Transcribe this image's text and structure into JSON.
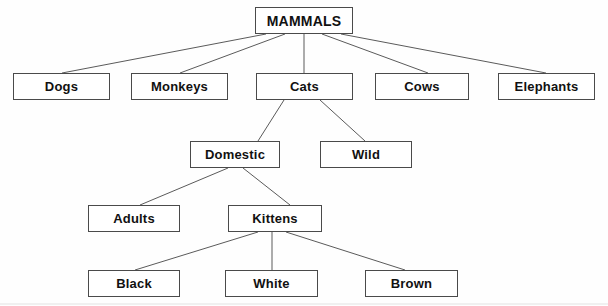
{
  "diagram": {
    "title": "MAMMALS",
    "type": "hierarchical-tree",
    "background_color": "#fefefe",
    "box_border_color": "#4a4a4a",
    "line_color": "#5a5a5a",
    "text_color": "#111111",
    "canvas": {
      "width": 608,
      "height": 306
    }
  },
  "nodes": [
    {
      "id": "mammals",
      "label": "MAMMALS",
      "level": 0,
      "x": 255,
      "y": 7,
      "w": 98,
      "h": 27,
      "font_size": 14,
      "parent": null
    },
    {
      "id": "dogs",
      "label": "Dogs",
      "level": 1,
      "x": 13,
      "y": 73,
      "w": 97,
      "h": 27,
      "font_size": 13,
      "parent": "mammals"
    },
    {
      "id": "monkeys",
      "label": "Monkeys",
      "level": 1,
      "x": 131,
      "y": 73,
      "w": 97,
      "h": 27,
      "font_size": 13,
      "parent": "mammals"
    },
    {
      "id": "cats",
      "label": "Cats",
      "level": 1,
      "x": 256,
      "y": 73,
      "w": 97,
      "h": 27,
      "font_size": 13,
      "parent": "mammals"
    },
    {
      "id": "cows",
      "label": "Cows",
      "level": 1,
      "x": 375,
      "y": 73,
      "w": 94,
      "h": 27,
      "font_size": 13,
      "parent": "mammals"
    },
    {
      "id": "elephants",
      "label": "Elephants",
      "level": 1,
      "x": 498,
      "y": 73,
      "w": 97,
      "h": 27,
      "font_size": 13,
      "parent": "mammals"
    },
    {
      "id": "domestic",
      "label": "Domestic",
      "level": 2,
      "x": 190,
      "y": 141,
      "w": 90,
      "h": 27,
      "font_size": 13,
      "parent": "cats"
    },
    {
      "id": "wild",
      "label": "Wild",
      "level": 2,
      "x": 320,
      "y": 141,
      "w": 92,
      "h": 27,
      "font_size": 13,
      "parent": "cats"
    },
    {
      "id": "adults",
      "label": "Adults",
      "level": 3,
      "x": 88,
      "y": 205,
      "w": 92,
      "h": 27,
      "font_size": 13,
      "parent": "domestic"
    },
    {
      "id": "kittens",
      "label": "Kittens",
      "level": 3,
      "x": 228,
      "y": 205,
      "w": 94,
      "h": 27,
      "font_size": 13,
      "parent": "domestic"
    },
    {
      "id": "black",
      "label": "Black",
      "level": 4,
      "x": 88,
      "y": 270,
      "w": 92,
      "h": 27,
      "font_size": 13,
      "parent": "kittens"
    },
    {
      "id": "white",
      "label": "White",
      "level": 4,
      "x": 225,
      "y": 270,
      "w": 93,
      "h": 27,
      "font_size": 13,
      "parent": "kittens"
    },
    {
      "id": "brown",
      "label": "Brown",
      "level": 4,
      "x": 365,
      "y": 270,
      "w": 93,
      "h": 27,
      "font_size": 13,
      "parent": "kittens"
    }
  ],
  "edges": [
    {
      "id": "mammals-dogs",
      "from": "mammals",
      "to": "dogs",
      "x1": 266,
      "y1": 34,
      "x2": 62,
      "y2": 73
    },
    {
      "id": "mammals-monkeys",
      "from": "mammals",
      "to": "monkeys",
      "x1": 285,
      "y1": 34,
      "x2": 180,
      "y2": 73
    },
    {
      "id": "mammals-cats",
      "from": "mammals",
      "to": "cats",
      "x1": 304,
      "y1": 34,
      "x2": 304,
      "y2": 73
    },
    {
      "id": "mammals-cows",
      "from": "mammals",
      "to": "cows",
      "x1": 322,
      "y1": 34,
      "x2": 428,
      "y2": 73
    },
    {
      "id": "mammals-elephants",
      "from": "mammals",
      "to": "elephants",
      "x1": 341,
      "y1": 34,
      "x2": 546,
      "y2": 73
    },
    {
      "id": "cats-domestic",
      "from": "cats",
      "to": "domestic",
      "x1": 284,
      "y1": 100,
      "x2": 258,
      "y2": 141
    },
    {
      "id": "cats-wild",
      "from": "cats",
      "to": "wild",
      "x1": 320,
      "y1": 100,
      "x2": 365,
      "y2": 141
    },
    {
      "id": "domestic-adults",
      "from": "domestic",
      "to": "adults",
      "x1": 228,
      "y1": 168,
      "x2": 140,
      "y2": 205
    },
    {
      "id": "domestic-kittens",
      "from": "domestic",
      "to": "kittens",
      "x1": 243,
      "y1": 168,
      "x2": 290,
      "y2": 205
    },
    {
      "id": "kittens-black",
      "from": "kittens",
      "to": "black",
      "x1": 258,
      "y1": 232,
      "x2": 135,
      "y2": 270
    },
    {
      "id": "kittens-white",
      "from": "kittens",
      "to": "white",
      "x1": 272,
      "y1": 232,
      "x2": 272,
      "y2": 270
    },
    {
      "id": "kittens-brown",
      "from": "kittens",
      "to": "brown",
      "x1": 286,
      "y1": 232,
      "x2": 405,
      "y2": 270
    }
  ]
}
